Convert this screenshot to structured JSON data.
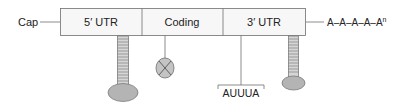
{
  "labels": {
    "cap": "Cap",
    "utr5": "5′ UTR",
    "coding": "Coding",
    "utr3": "3′ UTR",
    "polya": "A–A–A–A–A",
    "polya_sup": "n",
    "motif": "AUUUA"
  },
  "colors": {
    "box_fill": "#f7f7f7",
    "stroke": "#6e6e6e",
    "structure_fill": "#b4b4b4",
    "text": "#222222"
  }
}
